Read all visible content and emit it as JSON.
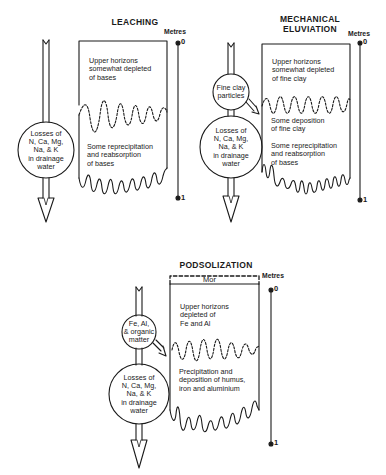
{
  "panels": [
    {
      "title": "LEACHING",
      "scale_label": "Metres",
      "scale_top": "0",
      "scale_bottom": "1",
      "upper_text": [
        "Upper horizons",
        "somewhat depleted",
        "of bases"
      ],
      "lower_text": [
        "Some reprecipitation",
        "and reabsorption",
        "of bases"
      ],
      "circles": [
        {
          "text": [
            "Losses of",
            "N, Ca, Mg,",
            "Na, & K",
            "in drainage",
            "water"
          ]
        }
      ]
    },
    {
      "title": "MECHANICAL ELUVIATION",
      "title_lines": [
        "MECHANICAL",
        "ELUVIATION"
      ],
      "scale_label": "Metres",
      "scale_top": "0",
      "scale_bottom": "1",
      "upper_text": [
        "Upper horizons",
        "somewhat depleted",
        "of fine clay"
      ],
      "middle_text": [
        "Some deposition",
        "of fine clay"
      ],
      "lower_text": [
        "Some reprecipitation",
        "and reabsorption",
        "of bases"
      ],
      "circles": [
        {
          "text": [
            "Fine clay",
            "particles"
          ]
        },
        {
          "text": [
            "Losses of",
            "N, Ca, Mg,",
            "Na, & K",
            "in drainage",
            "water"
          ]
        }
      ]
    },
    {
      "title": "PODSOLIZATION",
      "scale_label": "Metres",
      "scale_top": "0",
      "scale_bottom": "1",
      "top_layer": "Mor",
      "upper_text": [
        "Upper horizons",
        "depleted of",
        "Fe and Al"
      ],
      "lower_text": [
        "Precipitation and",
        "deposition of humus,",
        "iron and aluminium"
      ],
      "circles": [
        {
          "text": [
            "Fe, Al,",
            "& organic",
            "matter"
          ]
        },
        {
          "text": [
            "Losses of",
            "N, Ca, Mg,",
            "Na, & K",
            "in drainage",
            "water"
          ]
        }
      ]
    }
  ]
}
